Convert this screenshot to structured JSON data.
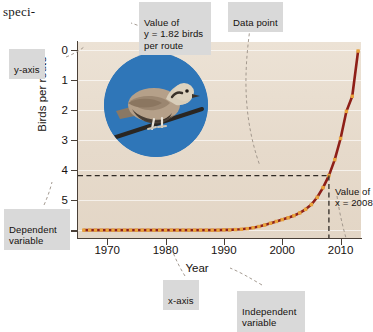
{
  "page_text_fragment": "speci-",
  "chart_data": {
    "type": "line",
    "title": "",
    "xlabel": "Year",
    "ylabel": "Birds per route",
    "xlim": [
      1965,
      2013.5
    ],
    "ylim": [
      -0.25,
      6.25
    ],
    "xticks": [
      1970,
      1980,
      1990,
      2000,
      2010
    ],
    "yticks": [
      0,
      1,
      2,
      3,
      4,
      5,
      6
    ],
    "grid": "horizontal",
    "legend": "none",
    "series": [
      {
        "name": "Eurasian collared-dove abundance",
        "line_color": "#8e1f18",
        "marker_color": "#e9a33c",
        "x": [
          1966,
          1967,
          1968,
          1969,
          1970,
          1971,
          1972,
          1973,
          1974,
          1975,
          1976,
          1977,
          1978,
          1979,
          1980,
          1981,
          1982,
          1983,
          1984,
          1985,
          1986,
          1987,
          1988,
          1989,
          1990,
          1991,
          1992,
          1993,
          1994,
          1995,
          1996,
          1997,
          1998,
          1999,
          2000,
          2001,
          2002,
          2003,
          2004,
          2005,
          2006,
          2007,
          2008,
          2009,
          2010,
          2011,
          2012,
          2013
        ],
        "y": [
          0.01,
          0.01,
          0.01,
          0.01,
          0.01,
          0.01,
          0.01,
          0.01,
          0.01,
          0.01,
          0.01,
          0.01,
          0.01,
          0.01,
          0.01,
          0.01,
          0.01,
          0.01,
          0.01,
          0.01,
          0.01,
          0.01,
          0.01,
          0.01,
          0.02,
          0.02,
          0.03,
          0.04,
          0.06,
          0.09,
          0.13,
          0.18,
          0.24,
          0.3,
          0.36,
          0.42,
          0.49,
          0.58,
          0.7,
          0.86,
          1.1,
          1.42,
          1.82,
          2.35,
          3.05,
          3.95,
          4.45,
          5.95
        ]
      }
    ],
    "annotations": {
      "highlight_x": 2008,
      "highlight_y": 1.82,
      "guide_style": "dashed"
    }
  },
  "labels": {
    "y_axis": "y-axis",
    "x_axis": "x-axis",
    "dependent_variable": "Dependent\nvariable",
    "independent_variable": "Independent\nvariable",
    "data_point": "Data point",
    "value_of_y": "Value of\ny = 1.82 birds\nper route",
    "value_of_x": "Value of\nx = 2008"
  },
  "axis_tick_labels": {
    "y": [
      "6",
      "5",
      "4",
      "3",
      "2",
      "1",
      "0"
    ],
    "x": [
      "1970",
      "1980",
      "1990",
      "2000",
      "2010"
    ]
  },
  "axis_titles": {
    "y": "Birds per route",
    "x": "Year"
  },
  "colors": {
    "plot_background": "#e7dbcc",
    "line": "#8e1f18",
    "marker": "#e9a33c",
    "callout_background": "#d9d9d9",
    "photo_background": "#2f76b8",
    "axis": "#4a4038"
  },
  "photo": {
    "subject": "eurasian-collared-dove",
    "description": "dove perched on wire"
  }
}
